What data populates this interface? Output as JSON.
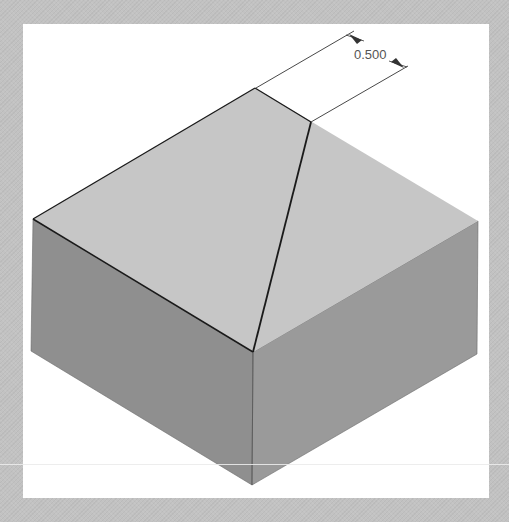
{
  "canvas": {
    "background_color": "#c2c2c2",
    "panel_color": "#ffffff"
  },
  "model": {
    "type": "isometric-box-with-cut-edge",
    "colors": {
      "top_face": "#c6c6c6",
      "left_face": "#8f8f8f",
      "right_face": "#9a9a9a",
      "edge": "#1a1a1a",
      "dimension_line": "#333333"
    }
  },
  "dimension": {
    "label": "0.500"
  }
}
